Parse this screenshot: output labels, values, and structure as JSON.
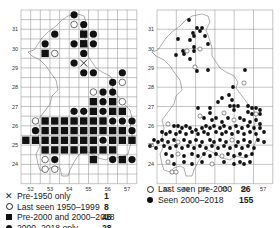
{
  "chart_data": [
    {
      "type": "scatter",
      "title": "",
      "subtype": "grid distribution map (10 km squares)",
      "xlabel": "",
      "ylabel": "",
      "x_ticks": [
        "52",
        "53",
        "54",
        "55",
        "56",
        "57"
      ],
      "y_ticks": [
        "24",
        "25",
        "26",
        "27",
        "28",
        "29",
        "30",
        "31"
      ],
      "grid": true,
      "legend_position": "bottom",
      "legend": [
        {
          "symbol": "cross",
          "label": "Pre-1950 only",
          "count": 1
        },
        {
          "symbol": "open-circle",
          "label": "Last seen 1950–1999",
          "count": 8
        },
        {
          "symbol": "filled-square",
          "label": "Pre-2000 and 2000–2018",
          "count": 46
        },
        {
          "symbol": "filled-circle",
          "label": "2000–2018 only",
          "count": 28
        }
      ]
    },
    {
      "type": "scatter",
      "title": "",
      "subtype": "grid distribution map (tetrads)",
      "xlabel": "",
      "ylabel": "",
      "x_ticks": [
        "52",
        "53",
        "54",
        "55",
        "56",
        "57"
      ],
      "y_ticks": [
        "24",
        "25",
        "26",
        "27",
        "28",
        "29",
        "30",
        "31"
      ],
      "grid": true,
      "legend_position": "bottom",
      "legend": [
        {
          "symbol": "open-circle",
          "label": "Last seen pre-2000",
          "count": 26
        },
        {
          "symbol": "filled-circle",
          "label": "Seen 2000–2018",
          "count": 155
        }
      ]
    }
  ],
  "left_map": {
    "x_ticks": [
      "52",
      "53",
      "54",
      "55",
      "56",
      "57"
    ],
    "y_ticks": [
      "31",
      "30",
      "29",
      "28",
      "27",
      "26",
      "25",
      "24"
    ],
    "legend": [
      {
        "symbol": "✕",
        "label": "Pre-1950 only",
        "count": "1"
      },
      {
        "symbol": "open-circle",
        "label": "Last seen 1950–1999",
        "count": "8"
      },
      {
        "symbol": "filled-square",
        "label": "Pre-2000 and 2000–2018",
        "count": "46"
      },
      {
        "symbol": "filled-circle",
        "label": "2000–2018 only",
        "count": "28"
      }
    ]
  },
  "right_map": {
    "x_ticks": [
      "52",
      "53",
      "54",
      "55",
      "56",
      "57"
    ],
    "y_ticks": [
      "31",
      "30",
      "29",
      "28",
      "27",
      "26",
      "25",
      "24"
    ],
    "legend": [
      {
        "symbol": "open-circle",
        "label": "Last seen pre-2000",
        "count": "26"
      },
      {
        "symbol": "filled-circle",
        "label": "Seen 2000–2018",
        "count": "155"
      }
    ]
  }
}
